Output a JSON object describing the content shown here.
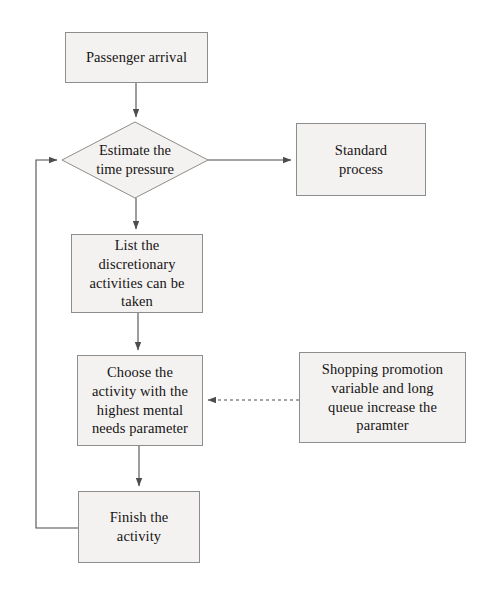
{
  "diagram": {
    "background_color": "#ffffff",
    "node_fill_color": "#f4f2f0",
    "node_border_color": "#8d8d8d",
    "connector_color": "#4d4d4d",
    "nodes": {
      "passenger_arrival": {
        "label": "Passenger arrival",
        "shape": "rectangle"
      },
      "estimate_time_pressure": {
        "label": "Estimate the\ntime pressure",
        "shape": "diamond"
      },
      "standard_process": {
        "label": "Standard\nprocess",
        "shape": "rectangle"
      },
      "list_activities": {
        "label": "List the\ndiscretionary\nactivities can be\ntaken",
        "shape": "rectangle"
      },
      "choose_activity": {
        "label": "Choose the\nactivity with the\nhighest mental\nneeds parameter",
        "shape": "rectangle"
      },
      "shopping_promotion": {
        "label": "Shopping promotion\nvariable and long\nqueue increase the\nparamter",
        "shape": "rectangle"
      },
      "finish_activity": {
        "label": "Finish the\nactivity",
        "shape": "rectangle"
      }
    },
    "edges": [
      {
        "name": "arrival-to-estimate",
        "from": "passenger_arrival",
        "to": "estimate_time_pressure",
        "style": "solid",
        "arrow": true
      },
      {
        "name": "estimate-to-standard",
        "from": "estimate_time_pressure",
        "to": "standard_process",
        "style": "solid",
        "arrow": true
      },
      {
        "name": "estimate-to-list",
        "from": "estimate_time_pressure",
        "to": "list_activities",
        "style": "solid",
        "arrow": true
      },
      {
        "name": "list-to-choose",
        "from": "list_activities",
        "to": "choose_activity",
        "style": "solid",
        "arrow": true
      },
      {
        "name": "choose-to-finish",
        "from": "choose_activity",
        "to": "finish_activity",
        "style": "solid",
        "arrow": true
      },
      {
        "name": "shopping-to-choose",
        "from": "shopping_promotion",
        "to": "choose_activity",
        "style": "dashed",
        "arrow": true
      },
      {
        "name": "finish-to-estimate-loop",
        "from": "finish_activity",
        "to": "estimate_time_pressure",
        "style": "solid",
        "arrow": true
      }
    ]
  }
}
